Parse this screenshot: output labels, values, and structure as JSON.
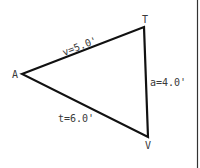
{
  "diagram": {
    "type": "triangle",
    "vertices": [
      {
        "label": "A",
        "x": 22,
        "y": 74
      },
      {
        "label": "T",
        "x": 144,
        "y": 27
      },
      {
        "label": "V",
        "x": 148,
        "y": 137
      }
    ],
    "sides": [
      {
        "name": "v",
        "label": "v=5.0'",
        "from": "A",
        "to": "T"
      },
      {
        "name": "a",
        "label": "a=4.0'",
        "from": "T",
        "to": "V"
      },
      {
        "name": "t",
        "label": "t=6.0'",
        "from": "A",
        "to": "V"
      }
    ],
    "colors": {
      "line": "#111111",
      "text": "#3a3a3a",
      "background": "#ffffff",
      "border": "#333333"
    }
  }
}
